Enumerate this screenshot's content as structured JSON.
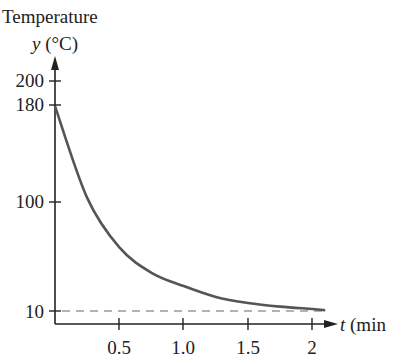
{
  "chart_data": {
    "type": "line",
    "title": "",
    "ylabel_line1": "Temperature",
    "ylabel_var": "y",
    "ylabel_unit": "(°C)",
    "xlabel_var": "t",
    "xlabel_unit": "(min",
    "x_ticks": [
      "0.5",
      "1.0",
      "1.5",
      "2"
    ],
    "x_tick_values": [
      0.5,
      1.0,
      1.5,
      2.0
    ],
    "y_ticks": [
      "200",
      "180",
      "100",
      "10"
    ],
    "y_tick_values": [
      200,
      180,
      100,
      10
    ],
    "xlim": [
      0,
      2.1
    ],
    "ylim": [
      0,
      210
    ],
    "grid": false,
    "series": [
      {
        "name": "Temperature curve",
        "style": "solid",
        "color": "#555555",
        "x": [
          0,
          0.25,
          0.5,
          0.75,
          1.0,
          1.25,
          1.5,
          1.75,
          2.0,
          2.1
        ],
        "y": [
          180,
          104,
          63,
          42,
          31,
          22,
          17,
          14,
          12,
          11
        ]
      },
      {
        "name": "Asymptote y=10",
        "style": "dashed",
        "color": "#999999",
        "x": [
          0,
          2.1
        ],
        "y": [
          10,
          10
        ]
      }
    ]
  }
}
